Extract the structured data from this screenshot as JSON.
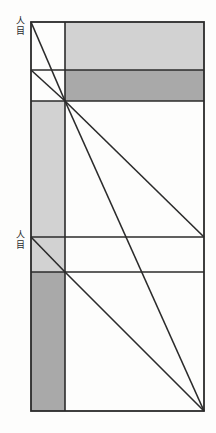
{
  "figure": {
    "canvas": {
      "width": 216,
      "height": 433
    },
    "background_color": "#fdfdfc",
    "stroke_color": "#2b2b2b",
    "stroke_width": 1.6,
    "fills": {
      "light_grey": "#d2d2d2",
      "dark_grey": "#a9a9a9",
      "white": "#ffffff"
    },
    "frame": {
      "x1": 31,
      "y1": 22,
      "x2": 204,
      "y2": 411
    },
    "vertical_lines": [
      {
        "name": "left-column-divider",
        "x": 65,
        "y1": 22,
        "y2": 411
      }
    ],
    "horizontal_lines": [
      {
        "name": "upper-band-top",
        "y": 22,
        "x1": 31,
        "x2": 204
      },
      {
        "name": "upper-band-split",
        "y": 70,
        "x1": 31,
        "x2": 204
      },
      {
        "name": "upper-vanishing-line",
        "y": 101,
        "x1": 31,
        "x2": 204
      },
      {
        "name": "lower-vanishing-line",
        "y": 237,
        "x1": 31,
        "x2": 204
      },
      {
        "name": "lower-band-split",
        "y": 272,
        "x1": 31,
        "x2": 204
      },
      {
        "name": "frame-bottom",
        "y": 411,
        "x1": 31,
        "x2": 204
      }
    ],
    "shaded_regions": [
      {
        "name": "upper-light-band",
        "x1": 65,
        "y1": 22,
        "x2": 204,
        "y2": 70,
        "fill": "light_grey"
      },
      {
        "name": "upper-dark-band",
        "x1": 65,
        "y1": 70,
        "x2": 204,
        "y2": 101,
        "fill": "dark_grey"
      },
      {
        "name": "left-column-light",
        "x1": 31,
        "y1": 101,
        "x2": 65,
        "y2": 237,
        "fill": "light_grey"
      },
      {
        "name": "left-column-mid-light",
        "x1": 31,
        "y1": 237,
        "x2": 65,
        "y2": 272,
        "fill": "light_grey"
      },
      {
        "name": "left-column-dark",
        "x1": 31,
        "y1": 272,
        "x2": 65,
        "y2": 411,
        "fill": "dark_grey"
      }
    ],
    "vanishing_points": [
      {
        "name": "upper-vanishing-point",
        "x": 65,
        "y": 101
      },
      {
        "name": "lower-vanishing-point",
        "x": 65,
        "y": 272
      }
    ],
    "rays": [
      {
        "name": "ray-topleft-to-upper-vp",
        "x1": 31,
        "y1": 22,
        "x2": 65,
        "y2": 101
      },
      {
        "name": "ray-leftsplit-to-upper-vp",
        "x1": 31,
        "y1": 70,
        "x2": 65,
        "y2": 101
      },
      {
        "name": "ray-upper-vp-to-right-mid",
        "x1": 65,
        "y1": 101,
        "x2": 204,
        "y2": 237
      },
      {
        "name": "ray-upper-vp-to-bottom-right",
        "x1": 65,
        "y1": 101,
        "x2": 204,
        "y2": 411
      },
      {
        "name": "ray-lowerleft-to-lower-vp",
        "x1": 31,
        "y1": 237,
        "x2": 65,
        "y2": 272
      },
      {
        "name": "ray-lower-vp-to-bottom-right",
        "x1": 65,
        "y1": 272,
        "x2": 204,
        "y2": 411
      }
    ],
    "labels": [
      {
        "name": "upper-eye-level-label",
        "chars": [
          "人",
          "目"
        ],
        "x": 14,
        "y": 16
      },
      {
        "name": "lower-eye-level-label",
        "chars": [
          "人",
          "目"
        ],
        "x": 14,
        "y": 230
      }
    ]
  }
}
